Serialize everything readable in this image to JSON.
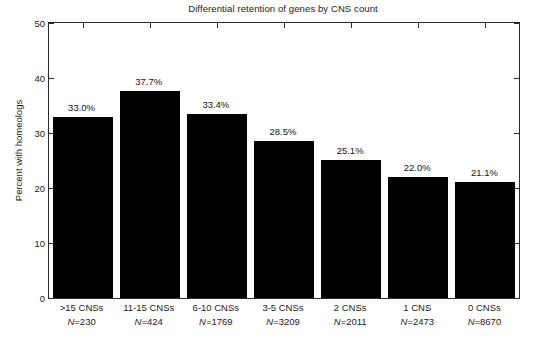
{
  "chart_data": {
    "type": "bar",
    "title": "Differential retention of genes by CNS count",
    "xlabel": "",
    "ylabel": "Percent with homeologs",
    "ylim": [
      0,
      50
    ],
    "yticks": [
      0,
      10,
      20,
      30,
      40,
      50
    ],
    "ytick_labels": [
      "0",
      "10",
      "20",
      "30",
      "40",
      "50"
    ],
    "grid": false,
    "legend": "none",
    "bar_color": "#000000",
    "categories": [
      ">15 CNSs",
      "11-15 CNSs",
      "6-10 CNSs",
      "3-5 CNSs",
      "2 CNSs",
      "1 CNS",
      "0 CNSs"
    ],
    "values": [
      33.0,
      37.7,
      33.4,
      28.5,
      25.1,
      22.0,
      21.1
    ],
    "value_labels": [
      "33.0%",
      "37.7%",
      "33.4%",
      "28.5%",
      "25.1%",
      "22.0%",
      "21.1%"
    ],
    "counts": [
      230,
      424,
      1769,
      3209,
      2011,
      2473,
      8670
    ],
    "count_labels": [
      "N=230",
      "N=424",
      "N=1769",
      "N=3209",
      "N=2011",
      "N=2473",
      "N=8670"
    ],
    "count_prefix": "N=",
    "count_values": [
      "230",
      "424",
      "1769",
      "3209",
      "2011",
      "2473",
      "8670"
    ]
  }
}
